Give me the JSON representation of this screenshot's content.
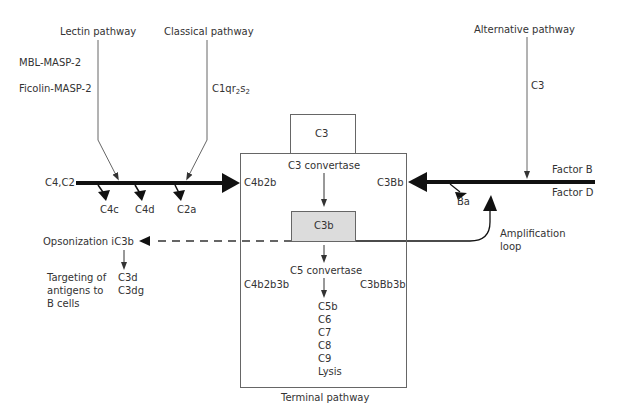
{
  "pathways": {
    "lectin": {
      "title": "Lectin pathway",
      "initiators": [
        "MBL-MASP-2",
        "Ficolin-MASP-2"
      ]
    },
    "classical": {
      "title": "Classical pathway",
      "initiator_base": "C1qr",
      "initiator_sub1": "2",
      "initiator_mid": "s",
      "initiator_sub2": "2"
    },
    "alternative": {
      "title": "Alternative pathway",
      "initiator": "C3",
      "factor_b": "Factor B",
      "factor_d": "Factor D",
      "cleavage": "Ba"
    }
  },
  "classical_lectin_axis": {
    "substrates": "C4,C2",
    "cleavage_products": [
      "C4c",
      "C4d",
      "C2a"
    ],
    "product": "C4b2b"
  },
  "central": {
    "c3_input": "C3",
    "c3_convertase": "C3 convertase",
    "c3b": "C3b",
    "c3bb": "C3Bb",
    "c5_convertase": "C5 convertase",
    "c5_convertase_classical": "C4b2b3b",
    "c5_convertase_alternative": "C3bBb3b",
    "terminal_components": [
      "C5b",
      "C6",
      "C7",
      "C8",
      "C9",
      "Lysis"
    ],
    "caption": "Terminal pathway"
  },
  "opsonization": {
    "label": "Opsonization iC3b",
    "targeting": [
      "Targeting of",
      "antigens to",
      "B cells"
    ],
    "fragments": [
      "C3d",
      "C3dg"
    ]
  },
  "amplification": {
    "lines": [
      "Amplification",
      "loop"
    ]
  },
  "colors": {
    "thick_arrow": "#111111",
    "thin_line": "#666666",
    "c3b_fill": "#dcdcdc"
  }
}
